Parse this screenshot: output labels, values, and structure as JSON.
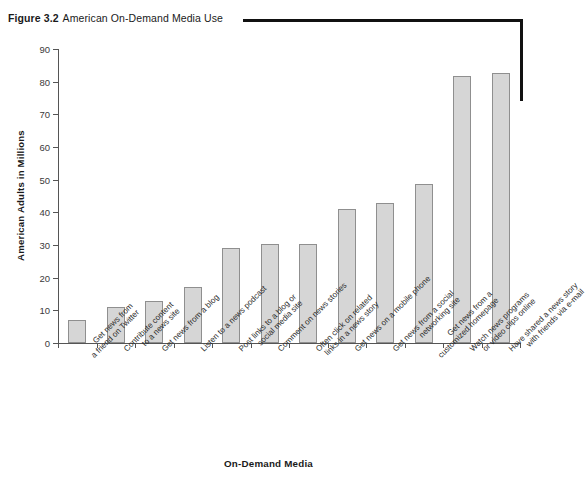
{
  "figure": {
    "number": "Figure 3.2",
    "title": "American On-Demand Media Use"
  },
  "chart_data": {
    "type": "bar",
    "title": "American On-Demand Media Use",
    "xlabel": "On-Demand Media",
    "ylabel": "American Adults in Millions",
    "ylim": [
      0,
      90
    ],
    "ytick_labels": [
      "0",
      "10",
      "20",
      "30",
      "40",
      "50",
      "60",
      "70",
      "80",
      "90"
    ],
    "ytick_values": [
      0,
      10,
      20,
      30,
      40,
      50,
      60,
      70,
      80,
      90
    ],
    "grid": false,
    "legend": null,
    "bar_color": "#d6d6d6",
    "bar_border_color": "#8f8f8f",
    "categories": [
      "Get news from a friend on Twitter",
      "Contribute content to a news site",
      "Get news from a blog",
      "Listen to a news podcast",
      "Post links to a blog or social media site",
      "Comment on news stories",
      "Often click on related links in a news story",
      "Get news on a mobile phone",
      "Get news from a social networking site",
      "Get news from a customized homepage",
      "Watch news programs or video clips online",
      "Have shared a news story with friends via e-mail"
    ],
    "category_lines": [
      [
        "Get news from",
        "a friend on Twitter"
      ],
      [
        "Contribute content",
        "to a news site"
      ],
      [
        "Get news from a blog"
      ],
      [
        "Listen to a news podcast"
      ],
      [
        "Post links to a blog or",
        "social media site"
      ],
      [
        "Comment on news stories"
      ],
      [
        "Often click on related",
        "links in a news story"
      ],
      [
        "Get news on a mobile phone"
      ],
      [
        "Get news from a social",
        "networking site"
      ],
      [
        "Get news from a",
        "customized homepage"
      ],
      [
        "Watch news programs",
        "or video clips online"
      ],
      [
        "Have shared a news story",
        "with friends via e-mail"
      ]
    ],
    "values": [
      7,
      11,
      13,
      17,
      29,
      30.2,
      30.3,
      41,
      42.8,
      48.8,
      81.7,
      82.8
    ]
  }
}
